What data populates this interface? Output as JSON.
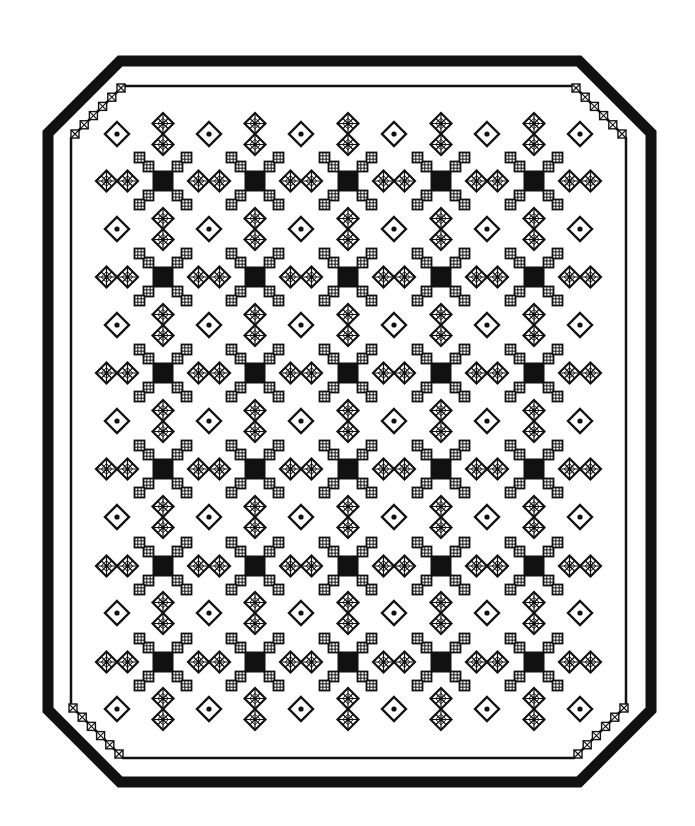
{
  "image": {
    "width": 695,
    "height": 826,
    "background": "#ffffff",
    "ink": "#111111",
    "subject": "Quilt / rug pattern illustration"
  },
  "border": {
    "outer_frame": {
      "left": 48,
      "top": 61,
      "right": 651,
      "bottom": 782,
      "chamfer": 72,
      "stroke_width": 11
    },
    "inner_frame": {
      "left": 71,
      "top": 86,
      "right": 626,
      "bottom": 758,
      "chamfer": 52,
      "stroke_width": 2.5
    },
    "corner_checks": {
      "count": 6,
      "size": 8,
      "step": 9.2
    }
  },
  "grid": {
    "cross_columns": [
      163,
      255,
      348,
      441,
      534
    ],
    "cross_rows": [
      181,
      277,
      373,
      469,
      566,
      662
    ],
    "dot_columns": [
      117,
      209,
      301,
      394,
      487,
      580
    ],
    "dot_rows": [
      134,
      229,
      325,
      421,
      517,
      613,
      709
    ]
  },
  "motifs": {
    "cross": {
      "name": "stepped-cross",
      "center_square": 21,
      "check_square": 10,
      "count": 30
    },
    "pair": {
      "name": "star-diamond-pair",
      "half_size": 10.5,
      "horizontal_count": 36,
      "vertical_count": 35
    },
    "dot": {
      "name": "dot-diamond",
      "half_size": 12,
      "dot_radius": 2.6,
      "count": 42
    }
  }
}
